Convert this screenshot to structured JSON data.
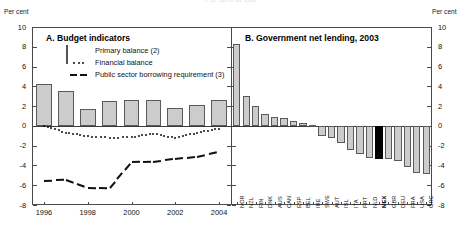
{
  "figure": {
    "clipped_title": "Per cent of GDP",
    "axis_caption_left": "Per cent",
    "axis_caption_right": "Per cent"
  },
  "y_axis": {
    "min": -8,
    "max": 10,
    "ticks": [
      10,
      8,
      6,
      4,
      2,
      0,
      -2,
      -4,
      -6,
      -8
    ],
    "labels": [
      "10",
      "8",
      "6",
      "4",
      "2",
      "0",
      "-2",
      "-4",
      "-6",
      "-8"
    ]
  },
  "panel_a": {
    "heading": "A.  Budget indicators",
    "legend": [
      {
        "key": "bar",
        "label": "Primary balance (2)"
      },
      {
        "key": "dots",
        "label": "Financial balance"
      },
      {
        "key": "dash",
        "label": "Public sector borrowing requirement (3)"
      }
    ],
    "x_tick_labels": [
      "1996",
      "1998",
      "2000",
      "2002",
      "2004"
    ]
  },
  "panel_b": {
    "heading": "B.  Government net lending, 2003"
  },
  "colors": {
    "bar_fill": "#cccccc",
    "bar_stroke": "#5a5a5a",
    "highlight_fill": "#000000",
    "frame": "#4a4a4a",
    "ink": "#111111"
  },
  "chart_data": [
    {
      "type": "bar",
      "id": "panel-a",
      "title": "A.  Budget indicators",
      "xlabel": "",
      "ylabel": "Per cent",
      "ylim": [
        -8,
        10
      ],
      "grid": false,
      "legend_position": "top-left",
      "categories": [
        "1996",
        "1997",
        "1998",
        "1999",
        "2000",
        "2001",
        "2002",
        "2003",
        "2004"
      ],
      "series": [
        {
          "name": "Primary balance (2)",
          "style": "bar",
          "values": [
            4.2,
            3.5,
            1.7,
            2.5,
            2.65,
            2.6,
            1.8,
            2.15,
            2.6
          ]
        },
        {
          "name": "Financial balance",
          "style": "dotted-line",
          "values": [
            -0.02,
            -0.68,
            -1.05,
            -1.2,
            -1.15,
            -0.78,
            -1.25,
            -0.68,
            -0.28
          ]
        },
        {
          "name": "Public sector borrowing requirement (3)",
          "style": "dashed-line",
          "values": [
            -5.55,
            -5.45,
            -6.25,
            -6.3,
            -3.7,
            -3.65,
            -3.35,
            -3.1,
            -2.6
          ]
        }
      ]
    },
    {
      "type": "bar",
      "id": "panel-b",
      "title": "B.  Government net lending, 2003",
      "xlabel": "",
      "ylabel": "Per cent",
      "ylim": [
        -8,
        10
      ],
      "grid": false,
      "highlight_category": "MEX",
      "categories": [
        "NOR",
        "NZL",
        "FIN",
        "DNK",
        "AUS",
        "CAN",
        "ESP",
        "BEL",
        "IRE",
        "SWE",
        "AUT",
        "ISL",
        "ITA",
        "PRT",
        "NLD",
        "MEX",
        "GBR",
        "DEU",
        "FRA",
        "USA",
        "GRC"
      ],
      "values": [
        8.3,
        3.05,
        2.05,
        1.2,
        0.85,
        0.75,
        0.45,
        0.3,
        0.1,
        -1.0,
        -1.25,
        -1.75,
        -2.4,
        -2.85,
        -3.2,
        -3.3,
        -3.4,
        -3.6,
        -4.2,
        -4.8,
        -4.9
      ]
    }
  ]
}
